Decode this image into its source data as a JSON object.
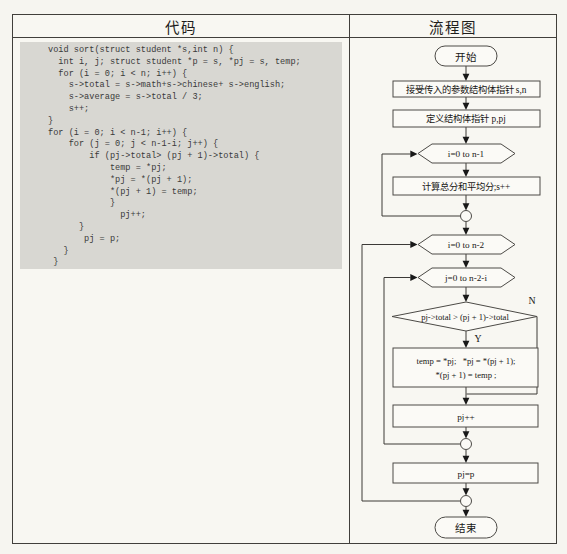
{
  "table": {
    "header": {
      "left": "代码",
      "right": "流程图"
    }
  },
  "code": {
    "lines": [
      "void sort(struct student *s,int n) {",
      "  int i, j; struct student *p = s, *pj = s, temp;",
      "  for (i = 0; i < n; i++) {",
      "    s->total = s->math+s->chinese+ s->english;",
      "    s->average = s->total / 3;",
      "    s++;",
      "}",
      "for (i = 0; i < n-1; i++) {",
      "    for (j = 0; j < n-1-i; j++) {",
      "        if (pj->total> (pj + 1)->total) {",
      "            temp = *pj;",
      "            *pj = *(pj + 1);",
      "            *(pj + 1) = temp;",
      "            }",
      "              pj++;",
      "      }",
      "       pj = p;",
      "   }",
      " }"
    ]
  },
  "flowchart": {
    "start": "开始",
    "accept_params": "接受传入的参数结构体指针 s,n",
    "define_pointers": "定义结构体指针 p,pj",
    "loop_i_1": "i=0 to n-1",
    "calc_total": "计算总分和平均分;s++",
    "loop_i_2": "i=0 to n-2",
    "loop_j": "j=0 to n-2-i",
    "decision": "pj->total > (pj + 1)->total",
    "swap_line1": "temp = *pj;   *pj = *(pj + 1);",
    "swap_line2": "*(pj + 1) = temp ;",
    "increment": "pj++",
    "reset": "pj=p",
    "end": "结束",
    "label_yes": "Y",
    "label_no": "N"
  },
  "colors": {
    "page_bg": "#f6f5f0",
    "table_bg": "#f8f7f2",
    "code_bg": "#d8d7d2",
    "border": "#413f3b",
    "shape_fill": "#fbfaf6",
    "shape_stroke": "#4c4a46",
    "text": "#181715"
  }
}
